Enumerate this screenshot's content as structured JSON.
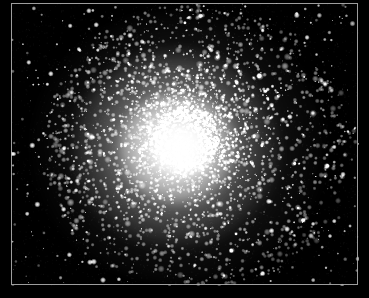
{
  "image": {
    "kind": "astronomical-photograph",
    "subject": "globular-star-cluster",
    "color_mode": "grayscale",
    "width": 369,
    "height": 298,
    "background_color": "#000000",
    "star_color": "#ffffff",
    "frame_rule_color": "#b8b8b8",
    "alt_text": "Black and white astronomical photograph of a globular star cluster: a dense, round, brilliant core of unresolved starlight surrounded by thousands of individually resolved white stars thinning outward into a sparse black sky field."
  },
  "frame": {
    "left": 11,
    "top": 3,
    "right": 358,
    "bottom": 285,
    "width": 347,
    "height": 282,
    "line_width": 1
  },
  "plate": {
    "left": 11,
    "top": 3,
    "width": 348,
    "height": 283
  },
  "cluster": {
    "center_x": 174,
    "center_y": 137,
    "core_radius": 30,
    "half_light_radius": 62,
    "halo_radius": 148,
    "core_peak_brightness": 255,
    "sky_background_brightness": 6
  },
  "render": {
    "seed": 20240517,
    "star_count_core": 2600,
    "star_count_halo": 1500,
    "star_count_field": 430,
    "min_star_radius": 0.6,
    "max_star_radius": 3.2
  }
}
